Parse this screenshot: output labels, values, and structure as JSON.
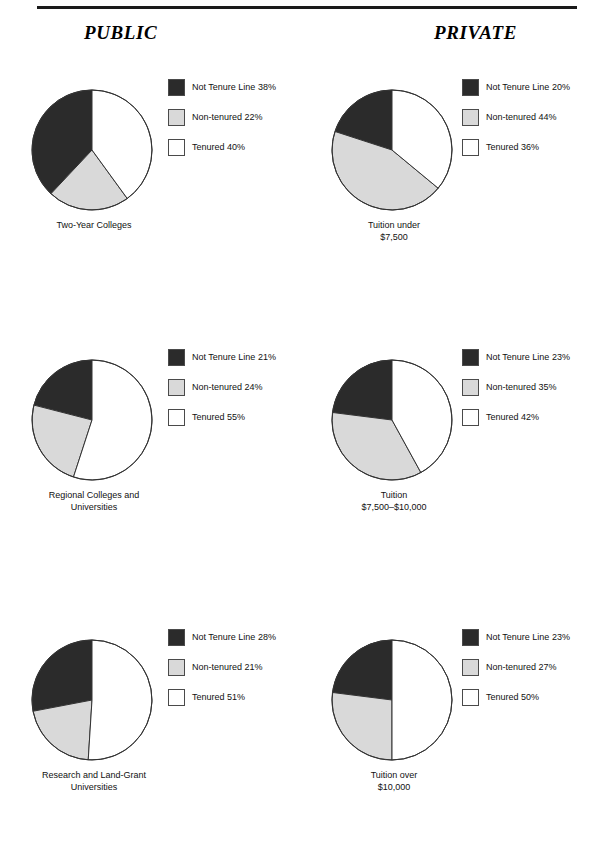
{
  "header": {
    "left_title": "PUBLIC",
    "right_title": "PRIVATE",
    "rule": true
  },
  "colors": {
    "not_tenure_line": "#2b2b2b",
    "non_tenured": "#d9d9d9",
    "tenured": "#ffffff",
    "outline": "#333333",
    "text": "#111111"
  },
  "series_names": [
    "Not Tenure Line",
    "Non-tenured",
    "Tenured"
  ],
  "chart_data": [
    {
      "type": "pie",
      "title": "Two-Year Colleges",
      "column": "PUBLIC",
      "caption_lines": [
        "Two-Year Colleges"
      ],
      "categories": [
        "Not Tenure Line",
        "Non-tenured",
        "Tenured"
      ],
      "values": [
        38,
        22,
        40
      ],
      "legend": [
        {
          "label": "Not Tenure Line 38%",
          "color": "#2b2b2b"
        },
        {
          "label": "Non-tenured 22%",
          "color": "#d9d9d9"
        },
        {
          "label": "Tenured 40%",
          "color": "#ffffff"
        }
      ],
      "legend_position": "right",
      "start_angle_deg": 90,
      "direction": "counterclockwise"
    },
    {
      "type": "pie",
      "title": "Tuition under $7,500",
      "column": "PRIVATE",
      "caption_lines": [
        "Tuition under",
        "$7,500"
      ],
      "categories": [
        "Not Tenure Line",
        "Non-tenured",
        "Tenured"
      ],
      "values": [
        20,
        44,
        36
      ],
      "legend": [
        {
          "label": "Not Tenure Line 20%",
          "color": "#2b2b2b"
        },
        {
          "label": "Non-tenured 44%",
          "color": "#d9d9d9"
        },
        {
          "label": "Tenured 36%",
          "color": "#ffffff"
        }
      ],
      "legend_position": "right",
      "start_angle_deg": 90,
      "direction": "counterclockwise"
    },
    {
      "type": "pie",
      "title": "Regional Colleges and Universities",
      "column": "PUBLIC",
      "caption_lines": [
        "Regional Colleges and",
        "Universities"
      ],
      "categories": [
        "Not Tenure Line",
        "Non-tenured",
        "Tenured"
      ],
      "values": [
        21,
        24,
        55
      ],
      "legend": [
        {
          "label": "Not Tenure Line 21%",
          "color": "#2b2b2b"
        },
        {
          "label": "Non-tenured 24%",
          "color": "#d9d9d9"
        },
        {
          "label": "Tenured 55%",
          "color": "#ffffff"
        }
      ],
      "legend_position": "right",
      "start_angle_deg": 90,
      "direction": "counterclockwise"
    },
    {
      "type": "pie",
      "title": "Tuition $7,500–$10,000",
      "column": "PRIVATE",
      "caption_lines": [
        "Tuition",
        "$7,500–$10,000"
      ],
      "categories": [
        "Not Tenure Line",
        "Non-tenured",
        "Tenured"
      ],
      "values": [
        23,
        35,
        42
      ],
      "legend": [
        {
          "label": "Not Tenure Line 23%",
          "color": "#2b2b2b"
        },
        {
          "label": "Non-tenured 35%",
          "color": "#d9d9d9"
        },
        {
          "label": "Tenured 42%",
          "color": "#ffffff"
        }
      ],
      "legend_position": "right",
      "start_angle_deg": 90,
      "direction": "counterclockwise"
    },
    {
      "type": "pie",
      "title": "Research and Land-Grant Universities",
      "column": "PUBLIC",
      "caption_lines": [
        "Research and Land-Grant",
        "Universities"
      ],
      "categories": [
        "Not Tenure Line",
        "Non-tenured",
        "Tenured"
      ],
      "values": [
        28,
        21,
        51
      ],
      "legend": [
        {
          "label": "Not Tenure Line 28%",
          "color": "#2b2b2b"
        },
        {
          "label": "Non-tenured 21%",
          "color": "#d9d9d9"
        },
        {
          "label": "Tenured 51%",
          "color": "#ffffff"
        }
      ],
      "legend_position": "right",
      "start_angle_deg": 90,
      "direction": "counterclockwise"
    },
    {
      "type": "pie",
      "title": "Tuition over $10,000",
      "column": "PRIVATE",
      "caption_lines": [
        "Tuition over",
        "$10,000"
      ],
      "categories": [
        "Not Tenure Line",
        "Non-tenured",
        "Tenured"
      ],
      "values": [
        23,
        27,
        50
      ],
      "legend": [
        {
          "label": "Not Tenure Line 23%",
          "color": "#2b2b2b"
        },
        {
          "label": "Non-tenured 27%",
          "color": "#d9d9d9"
        },
        {
          "label": "Tenured 50%",
          "color": "#ffffff"
        }
      ],
      "legend_position": "right",
      "start_angle_deg": 90,
      "direction": "counterclockwise"
    }
  ]
}
